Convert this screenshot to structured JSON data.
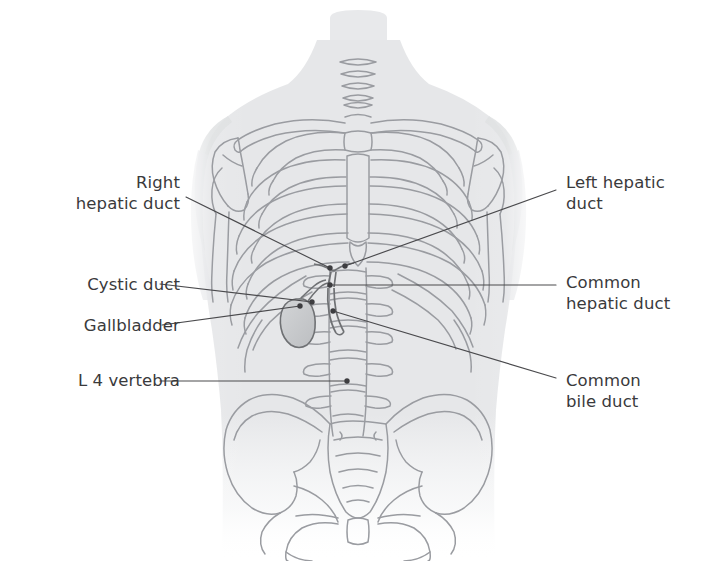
{
  "figure": {
    "background_color": "#ffffff",
    "text_color": "#3a3a3c",
    "leader_line_color": "#4a4a4d",
    "bone_outline_color": "#9a9ca1",
    "body_silhouette_color": "#e9eaec",
    "organ_fill_color": "#c9cbcd"
  },
  "labels": [
    {
      "id": "right-hepatic-duct",
      "text": "Right\nhepatic duct",
      "side": "left",
      "x": 35,
      "y": 172,
      "width": 145,
      "lines": 2
    },
    {
      "id": "cystic-duct",
      "text": "Cystic duct",
      "side": "left",
      "x": 35,
      "y": 274,
      "width": 145,
      "lines": 1
    },
    {
      "id": "gallbladder",
      "text": "Gallbladder",
      "side": "left",
      "x": 35,
      "y": 315,
      "width": 145,
      "lines": 1
    },
    {
      "id": "l4-vertebra",
      "text": "L 4 vertebra",
      "side": "left",
      "x": 35,
      "y": 370,
      "width": 145,
      "lines": 1
    },
    {
      "id": "left-hepatic-duct",
      "text": "Left hepatic\nduct",
      "side": "right",
      "x": 566,
      "y": 172,
      "width": 150,
      "lines": 2
    },
    {
      "id": "common-hepatic-duct",
      "text": "Common\nhepatic duct",
      "side": "right",
      "x": 566,
      "y": 272,
      "width": 150,
      "lines": 2
    },
    {
      "id": "common-bile-duct",
      "text": "Common\nbile duct",
      "side": "right",
      "x": 566,
      "y": 370,
      "width": 150,
      "lines": 2
    }
  ],
  "leader_lines": [
    {
      "id": "leader-right-hepatic-duct",
      "from": [
        186,
        197
      ],
      "to": [
        330,
        268
      ]
    },
    {
      "id": "leader-cystic-duct",
      "from": [
        160,
        284
      ],
      "to": [
        312,
        302
      ]
    },
    {
      "id": "leader-gallbladder",
      "from": [
        162,
        325
      ],
      "to": [
        300,
        306
      ]
    },
    {
      "id": "leader-l4-vertebra",
      "from": [
        160,
        381
      ],
      "to": [
        347,
        381
      ]
    },
    {
      "id": "leader-left-hepatic-duct",
      "from": [
        556,
        190
      ],
      "to": [
        345,
        266
      ]
    },
    {
      "id": "leader-common-hepatic-duct",
      "from": [
        556,
        285
      ],
      "to": [
        330,
        285
      ]
    },
    {
      "id": "leader-common-bile-duct",
      "from": [
        556,
        378
      ],
      "to": [
        333,
        311
      ]
    }
  ],
  "anchor_dots": [
    {
      "id": "dot-right-hepatic-duct",
      "x": 330,
      "y": 268
    },
    {
      "id": "dot-left-hepatic-duct",
      "x": 345,
      "y": 266
    },
    {
      "id": "dot-common-hepatic-duct",
      "x": 330,
      "y": 285
    },
    {
      "id": "dot-cystic-duct",
      "x": 312,
      "y": 302
    },
    {
      "id": "dot-gallbladder",
      "x": 300,
      "y": 306
    },
    {
      "id": "dot-common-bile-duct",
      "x": 333,
      "y": 311
    },
    {
      "id": "dot-l4-vertebra",
      "x": 347,
      "y": 381
    }
  ],
  "anatomy_structures": [
    "head-and-neck",
    "clavicles",
    "sternum",
    "rib-cage",
    "scapulae",
    "humeri",
    "thoracic-vertebrae",
    "lumbar-vertebrae",
    "sacrum",
    "pelvis",
    "gallbladder",
    "cystic-duct",
    "right-hepatic-duct",
    "left-hepatic-duct",
    "common-hepatic-duct",
    "common-bile-duct"
  ]
}
